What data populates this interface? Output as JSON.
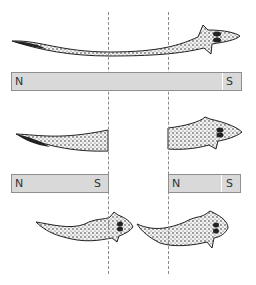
{
  "diagram": {
    "cut_lines": 2,
    "magnets": [
      {
        "id": "top",
        "north_label": "N",
        "south_label": "S"
      },
      {
        "id": "mid-left",
        "north_label": "N",
        "south_label": "S"
      },
      {
        "id": "mid-right",
        "north_label": "N",
        "south_label": "S"
      }
    ],
    "colors": {
      "bar_fill": "#d9d9d9",
      "bar_border": "#8f8f8f",
      "worm": "#2a2a2a",
      "cut_line": "#8a8a8a"
    }
  }
}
